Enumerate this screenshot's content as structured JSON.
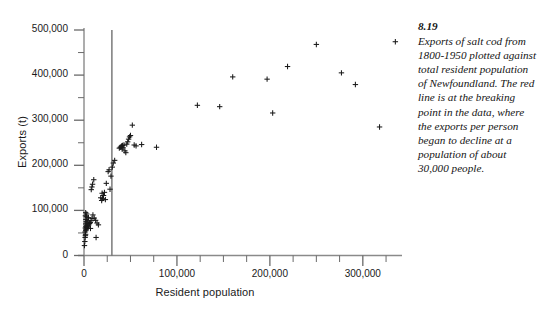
{
  "figure": {
    "axis_labels": {
      "x": "Resident population",
      "y": "Exports (t)"
    },
    "caption": {
      "number": "8.19",
      "text": "Exports of salt cod from 1800-1950 plotted against total resident population of Newfoundland. The red line is at the breaking point in the data, where the exports per person began to decline at a population of about 30,000 people."
    }
  },
  "chart_data": {
    "type": "scatter",
    "title": "",
    "xlabel": "Resident population",
    "ylabel": "Exports (t)",
    "xlim": [
      0,
      340000
    ],
    "ylim": [
      0,
      500000
    ],
    "xticks": [
      0,
      100000,
      200000,
      300000
    ],
    "xtick_labels": [
      "0",
      "100,000",
      "200,000",
      "300,000"
    ],
    "xminor_step": 25000,
    "yticks": [
      0,
      100000,
      200000,
      300000,
      400000,
      500000
    ],
    "ytick_labels": [
      "0",
      "100,000",
      "200,000",
      "300,000",
      "400,000",
      "500,000"
    ],
    "yminor_step": 50000,
    "grid": false,
    "legend": null,
    "marker": "plus",
    "marker_color": "#1a1a1a",
    "annotations": [
      {
        "type": "vline",
        "name": "breaking-point-line",
        "x": 30000,
        "color": "#7a7a7a",
        "described_as": "red line",
        "label": "breaking point at about 30,000 people"
      }
    ],
    "points": [
      [
        500,
        22000
      ],
      [
        900,
        31000
      ],
      [
        1200,
        40000
      ],
      [
        1500,
        44000
      ],
      [
        1700,
        47000
      ],
      [
        1100,
        52000
      ],
      [
        1900,
        55000
      ],
      [
        2300,
        57000
      ],
      [
        2600,
        59000
      ],
      [
        1400,
        61000
      ],
      [
        3000,
        62000
      ],
      [
        3400,
        63000
      ],
      [
        2100,
        64000
      ],
      [
        3800,
        65000
      ],
      [
        4400,
        66000
      ],
      [
        2800,
        67000
      ],
      [
        5200,
        68000
      ],
      [
        1800,
        70000
      ],
      [
        6000,
        71000
      ],
      [
        3200,
        72000
      ],
      [
        6800,
        73000
      ],
      [
        2400,
        75000
      ],
      [
        7600,
        77000
      ],
      [
        4000,
        78000
      ],
      [
        2000,
        80000
      ],
      [
        8600,
        82000
      ],
      [
        4800,
        84000
      ],
      [
        2600,
        86000
      ],
      [
        1500,
        88000
      ],
      [
        9600,
        90000
      ],
      [
        3000,
        92000
      ],
      [
        1800,
        95000
      ],
      [
        11000,
        83000
      ],
      [
        12500,
        78000
      ],
      [
        14000,
        72000
      ],
      [
        15500,
        68000
      ],
      [
        13000,
        40000
      ],
      [
        7000,
        60000
      ],
      [
        8500,
        152000
      ],
      [
        9200,
        158000
      ],
      [
        7800,
        146000
      ],
      [
        10500,
        168000
      ],
      [
        18000,
        128000
      ],
      [
        19000,
        122000
      ],
      [
        20000,
        126000
      ],
      [
        21000,
        133000
      ],
      [
        19500,
        138000
      ],
      [
        22000,
        140000
      ],
      [
        23000,
        124000
      ],
      [
        24000,
        160000
      ],
      [
        26000,
        186000
      ],
      [
        27000,
        190000
      ],
      [
        28000,
        147000
      ],
      [
        29000,
        176000
      ],
      [
        30500,
        196000
      ],
      [
        31500,
        205000
      ],
      [
        33000,
        211000
      ],
      [
        38000,
        238000
      ],
      [
        39000,
        240000
      ],
      [
        40000,
        241000
      ],
      [
        40500,
        243000
      ],
      [
        41000,
        236000
      ],
      [
        41500,
        244000
      ],
      [
        42000,
        239000
      ],
      [
        43000,
        245000
      ],
      [
        44000,
        232000
      ],
      [
        45000,
        228000
      ],
      [
        46000,
        247000
      ],
      [
        47000,
        252000
      ],
      [
        48000,
        258000
      ],
      [
        49000,
        263000
      ],
      [
        50000,
        266000
      ],
      [
        52000,
        289000
      ],
      [
        54000,
        245000
      ],
      [
        56000,
        243000
      ],
      [
        62000,
        246000
      ],
      [
        78000,
        240000
      ],
      [
        122000,
        333000
      ],
      [
        146000,
        330000
      ],
      [
        160000,
        396000
      ],
      [
        197000,
        391000
      ],
      [
        203000,
        316000
      ],
      [
        219000,
        419000
      ],
      [
        250000,
        468000
      ],
      [
        277000,
        405000
      ],
      [
        292000,
        379000
      ],
      [
        318000,
        285000
      ],
      [
        335000,
        474000
      ]
    ]
  }
}
